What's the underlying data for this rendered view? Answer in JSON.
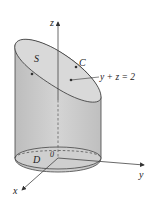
{
  "diagram": {
    "axis_labels": {
      "x": "x",
      "y": "y",
      "z": "z"
    },
    "point_labels": {
      "surface": "S",
      "curve": "C",
      "region": "D",
      "origin": "0"
    },
    "plane_equation": "y + z = 2",
    "colors": {
      "cylinder_side": "#c9c9c9",
      "cylinder_side_dark": "#b3b3b3",
      "top_ellipse": "#d9d9d9",
      "base_ellipse": "#cfcfcf",
      "stroke": "#333333",
      "axis": "#444444"
    }
  }
}
